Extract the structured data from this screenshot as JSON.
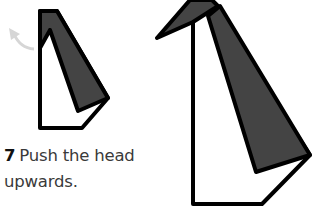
{
  "step": {
    "number": "7",
    "text_line1": "Push the head",
    "text_line2": "upwards."
  },
  "colors": {
    "outline": "#000000",
    "fill_dark": "#444444",
    "fill_light": "#ffffff",
    "arrow": "#d6d6d6",
    "text": "#3a3a3a"
  },
  "figures": [
    {
      "name": "before",
      "description": "folded paper with dark flap, arrow indicating upward push of head"
    },
    {
      "name": "after",
      "description": "folded paper with head pushed up forming beak"
    }
  ]
}
